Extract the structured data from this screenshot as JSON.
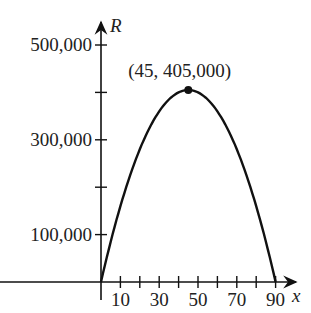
{
  "header": {
    "partial_label": "(c)"
  },
  "chart_data": {
    "type": "line",
    "title": "",
    "xlabel": "x",
    "ylabel": "R",
    "x_ticks": [
      10,
      20,
      30,
      40,
      50,
      60,
      70,
      80,
      90
    ],
    "x_tick_labels": [
      "10",
      "30",
      "50",
      "70",
      "90"
    ],
    "y_ticks": [
      100000,
      200000,
      300000,
      400000,
      500000
    ],
    "y_tick_labels": [
      "100,000",
      "300,000",
      "500,000"
    ],
    "xlim": [
      0,
      100
    ],
    "ylim": [
      0,
      500000
    ],
    "grid": false,
    "series": [
      {
        "name": "R",
        "function": "R = 18000x - 200x^2",
        "x": [
          0,
          10,
          20,
          30,
          40,
          45,
          50,
          60,
          70,
          80,
          90
        ],
        "y": [
          0,
          160000,
          280000,
          360000,
          400000,
          405000,
          400000,
          360000,
          280000,
          160000,
          0
        ]
      }
    ],
    "annotations": [
      {
        "text": "(45, 405,000)",
        "x": 45,
        "y": 405000,
        "marker": "dot"
      }
    ]
  }
}
